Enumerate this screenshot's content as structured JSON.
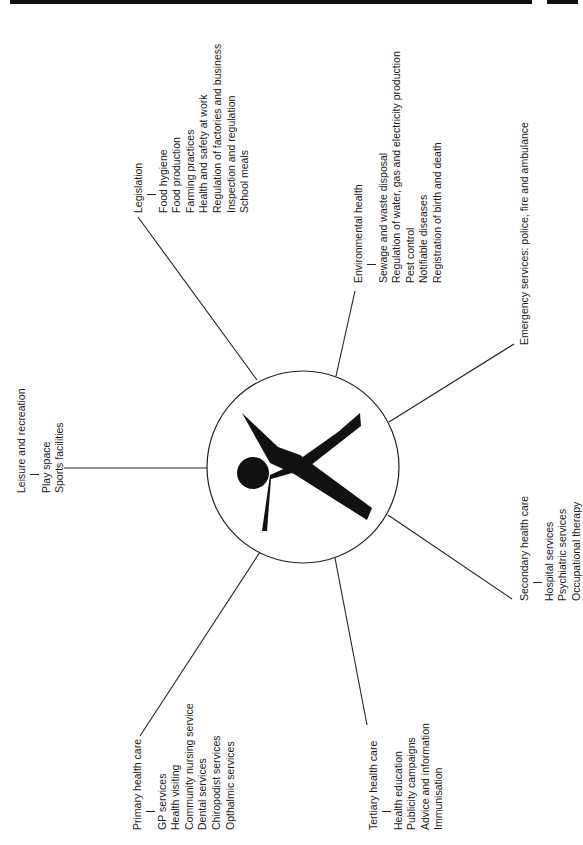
{
  "header": {
    "running_title": "An Introduction to Social Policy"
  },
  "diagram": {
    "center_icon": "person-figure-icon",
    "branches": [
      {
        "id": "leisure",
        "title": "Leisure and recreation",
        "items": [
          "Play space",
          "Sports facilities"
        ]
      },
      {
        "id": "legislation",
        "title": "Legislation",
        "items": [
          "Food hygiene",
          "Food production",
          "Farming practices",
          "Health and safety at work",
          "Regulation of factories and business",
          "Inspection and regulation",
          "School meals"
        ]
      },
      {
        "id": "environmental",
        "title": "Environmental health",
        "items": [
          "Sewage and waste disposal",
          "Regulation of water, gas and electricity production",
          "Pest control",
          "Notifiable diseases",
          "Registration of birth and death"
        ]
      },
      {
        "id": "emergency",
        "title": "Emergency services: police, fire and ambulance",
        "items": []
      },
      {
        "id": "secondary",
        "title": "Secondary health care",
        "items": [
          "Hospital services",
          "Psychiatric services",
          "Occupational therapy"
        ]
      },
      {
        "id": "tertiary",
        "title": "Tertiary health care",
        "items": [
          "Health education",
          "Publicity campaigns",
          "Advice and information",
          "Immunisation"
        ]
      },
      {
        "id": "primary",
        "title": "Primary health care",
        "items": [
          "GP services",
          "Health visiting",
          "Community nursing service",
          "Dental services",
          "Chiropodist services",
          "Opthalmic services"
        ]
      }
    ]
  }
}
